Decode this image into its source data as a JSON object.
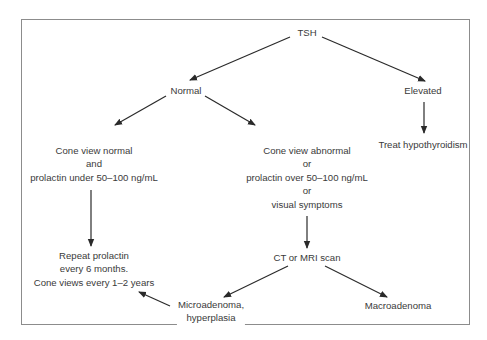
{
  "diagram": {
    "type": "flowchart",
    "nodes": {
      "tsh": "TSH",
      "normal": "Normal",
      "elevated": "Elevated",
      "treat": "Treat hypothyroidism",
      "cone_normal": {
        "line1": "Cone view normal",
        "line2": "and",
        "line3": "prolactin under 50–100 ng/mL"
      },
      "cone_abnormal": {
        "line1": "Cone view abnormal",
        "line2": "or",
        "line3": "prolactin over 50–100 ng/mL",
        "line4": "or",
        "line5": "visual symptoms"
      },
      "repeat": {
        "line1": "Repeat prolactin",
        "line2": "every 6 months.",
        "line3": "Cone views every 1–2 years"
      },
      "ct_mri": "CT or MRI scan",
      "micro": {
        "line1": "Microadenoma,",
        "line2": "hyperplasia"
      },
      "macro": "Macroadenoma"
    },
    "edges": [
      {
        "from": "TSH",
        "to": "Normal"
      },
      {
        "from": "TSH",
        "to": "Elevated"
      },
      {
        "from": "Elevated",
        "to": "Treat hypothyroidism"
      },
      {
        "from": "Normal",
        "to": "Cone view normal and prolactin under 50–100 ng/mL"
      },
      {
        "from": "Normal",
        "to": "Cone view abnormal or prolactin over 50–100 ng/mL or visual symptoms"
      },
      {
        "from": "Cone view normal and prolactin under 50–100 ng/mL",
        "to": "Repeat prolactin every 6 months. Cone views every 1–2 years"
      },
      {
        "from": "Cone view abnormal or prolactin over 50–100 ng/mL or visual symptoms",
        "to": "CT or MRI scan"
      },
      {
        "from": "CT or MRI scan",
        "to": "Microadenoma, hyperplasia"
      },
      {
        "from": "CT or MRI scan",
        "to": "Macroadenoma"
      },
      {
        "from": "Microadenoma, hyperplasia",
        "to": "Repeat prolactin every 6 months. Cone views every 1–2 years"
      }
    ],
    "colors": {
      "line": "#2a2a2a",
      "text": "#3a3a3a",
      "frame": "#8c8c8c"
    }
  }
}
